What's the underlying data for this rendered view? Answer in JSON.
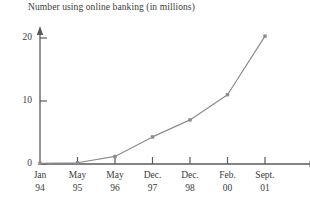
{
  "chart_data": {
    "type": "line",
    "title": "Number using online banking (in millions)",
    "xlabel": "",
    "ylabel": "",
    "categories": [
      "Jan 94",
      "May 95",
      "May 96",
      "Dec. 97",
      "Dec. 98",
      "Feb. 00",
      "Sept. 01"
    ],
    "category_lines": [
      {
        "month": "Jan",
        "year": "94"
      },
      {
        "month": "May",
        "year": "95"
      },
      {
        "month": "May",
        "year": "96"
      },
      {
        "month": "Dec.",
        "year": "97"
      },
      {
        "month": "Dec.",
        "year": "98"
      },
      {
        "month": "Feb.",
        "year": "00"
      },
      {
        "month": "Sept.",
        "year": "01"
      }
    ],
    "values": [
      0.1,
      0.2,
      1.2,
      4.3,
      7.0,
      11.0,
      20.3
    ],
    "ylim": [
      0,
      22
    ],
    "yticks": [
      0,
      10,
      20
    ],
    "ytick_labels": [
      "0",
      "10",
      "20"
    ],
    "grid": false,
    "legend": "none",
    "series_color": "#8c8c8c",
    "axis_color": "#5a5a5a",
    "marker": "square"
  }
}
